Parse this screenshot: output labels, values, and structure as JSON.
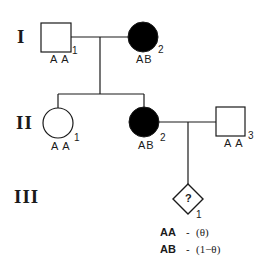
{
  "generations": [
    {
      "label": "I"
    },
    {
      "label": "II"
    },
    {
      "label": "III"
    }
  ],
  "individuals": {
    "I1": {
      "sex": "male",
      "affected": false,
      "genotype": "A A",
      "number": "1"
    },
    "I2": {
      "sex": "female",
      "affected": true,
      "genotype": "AB",
      "number": "2"
    },
    "II1": {
      "sex": "female",
      "affected": false,
      "genotype": "A A",
      "number": "1"
    },
    "II2": {
      "sex": "female",
      "affected": true,
      "genotype": "AB",
      "number": "2"
    },
    "II3": {
      "sex": "male",
      "affected": false,
      "genotype": "A A",
      "number": "3"
    },
    "III1": {
      "sex": "unknown",
      "affected": false,
      "genotype": "?",
      "number": "1"
    }
  },
  "legend": [
    {
      "genotype": "AA",
      "dash": "-",
      "probability": "(θ)"
    },
    {
      "genotype": "AB",
      "dash": "-",
      "probability": "(1−θ)"
    }
  ],
  "colors": {
    "line": "#1a1a1a",
    "affected_fill": "#000000",
    "unaffected_fill": "#ffffff"
  }
}
